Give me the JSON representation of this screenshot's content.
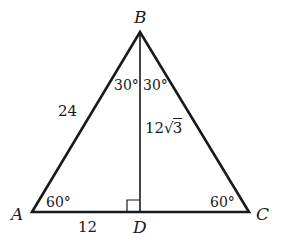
{
  "diagram": {
    "type": "triangle",
    "stroke_color": "#1a1a1a",
    "vertices": {
      "A": {
        "label": "A",
        "x": 32,
        "y": 212
      },
      "B": {
        "label": "B",
        "x": 140,
        "y": 32
      },
      "C": {
        "label": "C",
        "x": 249,
        "y": 212
      },
      "D": {
        "label": "D",
        "x": 140,
        "y": 212
      }
    },
    "angles": {
      "A": "60°",
      "C": "60°",
      "B_left": "30°",
      "B_right": "30°"
    },
    "lengths": {
      "AB": "24",
      "AD": "12",
      "BD_coef": "12",
      "BD_radicand": "3"
    },
    "right_angle_at": "D"
  }
}
